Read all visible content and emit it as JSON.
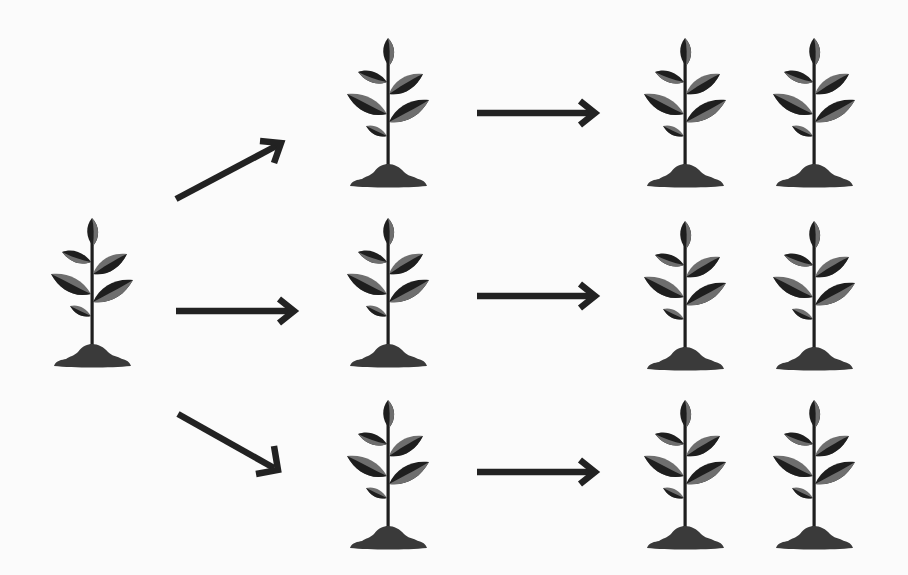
{
  "diagram": {
    "colors": {
      "background": "#fbfbfb",
      "ink": "#222222",
      "leaf_dark": "#1e1e1e",
      "leaf_light": "#6e6e6e",
      "soil": "#3a3a3a"
    },
    "stages": [
      {
        "label": "Parent plant",
        "count": 1
      },
      {
        "label": "First generation",
        "count": 3
      },
      {
        "label": "Second generation",
        "count": 6
      }
    ],
    "nodes": [
      {
        "id": "parent",
        "x": 50,
        "y": 216
      },
      {
        "id": "gen1-top",
        "x": 346,
        "y": 36
      },
      {
        "id": "gen1-mid",
        "x": 346,
        "y": 216
      },
      {
        "id": "gen1-bot",
        "x": 346,
        "y": 398
      },
      {
        "id": "gen2-top-a",
        "x": 643,
        "y": 36
      },
      {
        "id": "gen2-top-b",
        "x": 772,
        "y": 36
      },
      {
        "id": "gen2-mid-a",
        "x": 643,
        "y": 219
      },
      {
        "id": "gen2-mid-b",
        "x": 772,
        "y": 219
      },
      {
        "id": "gen2-bot-a",
        "x": 643,
        "y": 398
      },
      {
        "id": "gen2-bot-b",
        "x": 772,
        "y": 398
      }
    ],
    "edges": [
      {
        "from": "parent",
        "to": "gen1-top",
        "direction": "up-right"
      },
      {
        "from": "parent",
        "to": "gen1-mid",
        "direction": "right"
      },
      {
        "from": "parent",
        "to": "gen1-bot",
        "direction": "down-right"
      },
      {
        "from": "gen1-top",
        "to": "gen2-top",
        "direction": "right"
      },
      {
        "from": "gen1-mid",
        "to": "gen2-mid",
        "direction": "right"
      },
      {
        "from": "gen1-bot",
        "to": "gen2-bot",
        "direction": "right"
      }
    ],
    "icons": {
      "plant": "sapling-icon",
      "arrow": "arrow-icon"
    }
  }
}
